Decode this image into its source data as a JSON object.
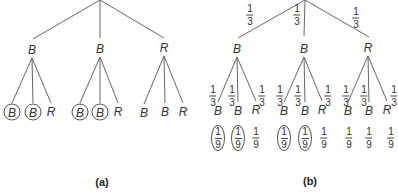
{
  "panels": [
    {
      "caption": "(a)",
      "root": {
        "x": 100,
        "y": 0
      },
      "level1": [
        {
          "label": "B",
          "x": 32,
          "y": 50,
          "edge_end": {
            "x": 33,
            "y": 39
          }
        },
        {
          "label": "B",
          "x": 100,
          "y": 49,
          "edge_end": {
            "x": 100,
            "y": 38
          }
        },
        {
          "label": "R",
          "x": 164,
          "y": 48,
          "edge_end": {
            "x": 164,
            "y": 38
          }
        }
      ],
      "level2": [
        {
          "label": "B",
          "circled": true,
          "x": 12,
          "y": 112,
          "parent": 0
        },
        {
          "label": "B",
          "circled": true,
          "x": 33,
          "y": 112,
          "parent": 0
        },
        {
          "label": "R",
          "circled": false,
          "x": 51,
          "y": 112,
          "parent": 0
        },
        {
          "label": "B",
          "circled": true,
          "x": 80,
          "y": 112,
          "parent": 1
        },
        {
          "label": "B",
          "circled": true,
          "x": 100,
          "y": 112,
          "parent": 1
        },
        {
          "label": "R",
          "circled": false,
          "x": 118,
          "y": 112,
          "parent": 1
        },
        {
          "label": "B",
          "circled": false,
          "x": 144,
          "y": 113,
          "parent": 2
        },
        {
          "label": "B",
          "circled": false,
          "x": 165,
          "y": 112,
          "parent": 2
        },
        {
          "label": "R",
          "circled": false,
          "x": 183,
          "y": 112,
          "parent": 2
        }
      ],
      "caption_pos": {
        "x": 102,
        "y": 182
      }
    },
    {
      "caption": "(b)",
      "root": {
        "x": 305,
        "y": 0
      },
      "level1": [
        {
          "label": "B",
          "x": 237,
          "y": 49,
          "edge_end": {
            "x": 238,
            "y": 38
          },
          "prob": {
            "num": "1",
            "den": "3",
            "x": 250,
            "y": 15
          }
        },
        {
          "label": "B",
          "x": 304,
          "y": 49,
          "edge_end": {
            "x": 304,
            "y": 36
          },
          "prob": {
            "num": "1",
            "den": "3",
            "x": 297,
            "y": 15
          }
        },
        {
          "label": "R",
          "x": 368,
          "y": 48,
          "edge_end": {
            "x": 369,
            "y": 37
          },
          "prob": {
            "num": "1",
            "den": "3",
            "x": 356,
            "y": 18
          }
        }
      ],
      "level2": [
        {
          "label": "B",
          "x": 218,
          "y": 111,
          "parent": 0,
          "prob": {
            "num": "1",
            "den": "3",
            "x": 213,
            "y": 96
          },
          "joint": {
            "num": "1",
            "den": "9",
            "x": 218,
            "y": 138,
            "circled": true
          }
        },
        {
          "label": "B",
          "x": 238,
          "y": 111,
          "parent": 0,
          "prob": {
            "num": "1",
            "den": "3",
            "x": 232,
            "y": 96
          },
          "joint": {
            "num": "1",
            "den": "9",
            "x": 238,
            "y": 138,
            "circled": true
          }
        },
        {
          "label": "R",
          "x": 256,
          "y": 110,
          "parent": 0,
          "prob": {
            "num": "1",
            "den": "3",
            "x": 262,
            "y": 96
          },
          "joint": {
            "num": "1",
            "den": "9",
            "x": 256,
            "y": 138,
            "circled": false
          }
        },
        {
          "label": "B",
          "x": 284,
          "y": 111,
          "parent": 1,
          "prob": {
            "num": "1",
            "den": "3",
            "x": 280,
            "y": 96
          },
          "joint": {
            "num": "1",
            "den": "9",
            "x": 284,
            "y": 138,
            "circled": true
          }
        },
        {
          "label": "B",
          "x": 305,
          "y": 111,
          "parent": 1,
          "prob": {
            "num": "1",
            "den": "3",
            "x": 298,
            "y": 96
          },
          "joint": {
            "num": "1",
            "den": "9",
            "x": 305,
            "y": 138,
            "circled": true
          }
        },
        {
          "label": "R",
          "x": 322,
          "y": 110,
          "parent": 1,
          "prob": {
            "num": "1",
            "den": "3",
            "x": 328,
            "y": 96
          },
          "joint": {
            "num": "1",
            "den": "9",
            "x": 324,
            "y": 138,
            "circled": false
          }
        },
        {
          "label": "B",
          "x": 348,
          "y": 111,
          "parent": 2,
          "prob": {
            "num": "1",
            "den": "3",
            "x": 346,
            "y": 96
          },
          "joint": {
            "num": "1",
            "den": "9",
            "x": 349,
            "y": 138,
            "circled": false
          }
        },
        {
          "label": "B",
          "x": 369,
          "y": 111,
          "parent": 2,
          "prob": {
            "num": "1",
            "den": "3",
            "x": 364,
            "y": 96
          },
          "joint": {
            "num": "1",
            "den": "9",
            "x": 369,
            "y": 138,
            "circled": false
          }
        },
        {
          "label": "R",
          "x": 387,
          "y": 110,
          "parent": 2,
          "prob": {
            "num": "1",
            "den": "3",
            "x": 394,
            "y": 96
          },
          "joint": {
            "num": "1",
            "den": "9",
            "x": 391,
            "y": 138,
            "circled": false
          }
        }
      ],
      "caption_pos": {
        "x": 310,
        "y": 181
      }
    }
  ],
  "colors": {
    "line": "#666666",
    "text": "#333333",
    "background": "#ffffff"
  }
}
